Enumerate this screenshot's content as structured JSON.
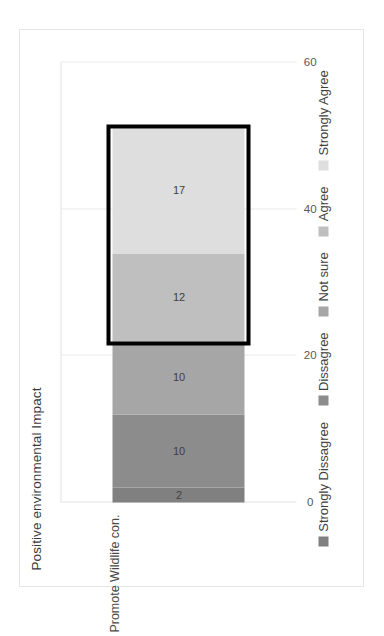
{
  "chart_data": {
    "type": "bar",
    "orientation": "horizontal-stacked",
    "title": "Positive environmental Impact",
    "xlabel": "",
    "ylabel": "",
    "categories": [
      "Promote Wildlife con."
    ],
    "xlim": [
      0,
      60
    ],
    "ticks": [
      "0",
      "20",
      "40",
      "60"
    ],
    "tick_values": [
      0,
      20,
      40,
      60
    ],
    "grid": true,
    "legend_position": "bottom",
    "series": [
      {
        "name": "Strongly Dissagree",
        "values": [
          2
        ],
        "color": "#808080"
      },
      {
        "name": "Dissagree",
        "values": [
          10
        ],
        "color": "#8c8c8c"
      },
      {
        "name": "Not sure",
        "values": [
          10
        ],
        "color": "#a6a6a6"
      },
      {
        "name": "Agree",
        "values": [
          12
        ],
        "color": "#bfbfbf"
      },
      {
        "name": "Strongly Agree",
        "values": [
          17
        ],
        "color": "#dedede"
      }
    ],
    "data_labels": [
      "2",
      "10",
      "10",
      "12",
      "17"
    ],
    "annotations": [
      {
        "type": "highlight-rectangle",
        "color": "#000000",
        "covers": [
          "Agree",
          "Strongly Agree"
        ]
      }
    ]
  },
  "legend": {
    "items": [
      {
        "label": "Strongly Dissagree",
        "color": "#808080"
      },
      {
        "label": "Dissagree",
        "color": "#8c8c8c"
      },
      {
        "label": "Not sure",
        "color": "#a6a6a6"
      },
      {
        "label": "Agree",
        "color": "#bfbfbf"
      },
      {
        "label": "Strongly Agree",
        "color": "#dedede"
      }
    ]
  }
}
